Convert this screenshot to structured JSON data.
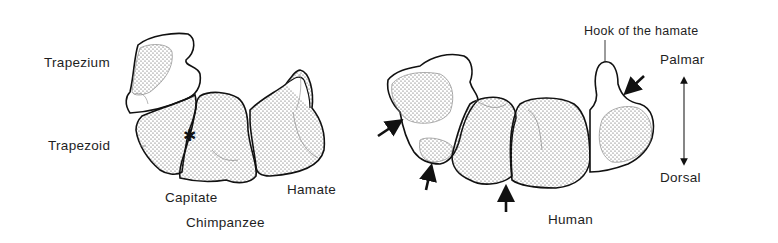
{
  "figure": {
    "panels": [
      {
        "id": "chimpanzee",
        "caption": "Chimpanzee",
        "bones": [
          {
            "name": "Trapezium",
            "label": "Trapezium"
          },
          {
            "name": "Trapezoid",
            "label": "Trapezoid"
          },
          {
            "name": "Capitate",
            "label": "Capitate"
          },
          {
            "name": "Hamate",
            "label": "Hamate"
          }
        ],
        "marker": "*"
      },
      {
        "id": "human",
        "caption": "Human",
        "annotation": "Hook of the hamate",
        "arrow_count": 4
      }
    ],
    "orientation": {
      "top_label": "Palmar",
      "bottom_label": "Dorsal"
    }
  },
  "colors": {
    "outline": "#111111",
    "stipple": "#444444",
    "background": "#ffffff"
  }
}
